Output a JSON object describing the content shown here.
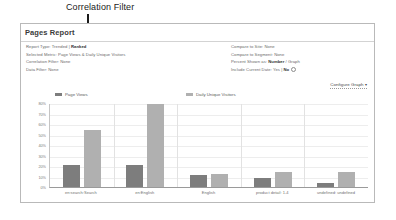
{
  "annotation": {
    "label": "Correlation Filter"
  },
  "panel": {
    "title": "Pages Report",
    "meta_left": [
      {
        "label": "Report Type:",
        "value": "Trended | ",
        "emphasis": "Ranked"
      },
      {
        "label": "Selected Metric:",
        "value": "Page Views & Daily Unique Visitors",
        "emphasis": ""
      },
      {
        "label": "Correlation Filter:",
        "value": "None",
        "emphasis": ""
      },
      {
        "label": "Data Filter:",
        "value": "None",
        "emphasis": ""
      }
    ],
    "meta_right": [
      {
        "label": "Compare to Site:",
        "value": "None",
        "emphasis": ""
      },
      {
        "label": "Compare to Segment:",
        "value": "None",
        "emphasis": ""
      },
      {
        "label": "Percent Shown as:",
        "value": " / Graph",
        "emphasis": "Number"
      },
      {
        "label": "Include Current Date:",
        "value": "Yes | ",
        "emphasis": "No"
      }
    ],
    "configure_button": "Configure Graph",
    "configure_caret": "▾"
  },
  "chart_data": {
    "type": "bar",
    "title": "",
    "xlabel": "",
    "ylabel": "",
    "ylim": [
      0,
      80
    ],
    "grid": true,
    "legend_position": "top",
    "ytick_labels": [
      "80%",
      "70%",
      "60%",
      "50%",
      "40%",
      "30%",
      "20%",
      "10%",
      "0%"
    ],
    "ytick_values": [
      80,
      70,
      60,
      50,
      40,
      30,
      20,
      10,
      0
    ],
    "categories": [
      "en:search:Search",
      "en:English",
      "English",
      "product detail: 1-4",
      "undefined: undefined"
    ],
    "series": [
      {
        "name": "Page Views",
        "color": "#7d7d7d",
        "values": [
          21,
          21,
          11,
          9,
          4
        ]
      },
      {
        "name": "Daily Unique Visitors",
        "color": "#b0b0b0",
        "values": [
          54,
          79,
          12,
          14,
          14
        ]
      }
    ]
  },
  "colors": {
    "page_views": "#7d7d7d",
    "daily_unique_visitors": "#b0b0b0",
    "panel_border": "#b9b9b9",
    "annotation": "#1a1a1a"
  }
}
